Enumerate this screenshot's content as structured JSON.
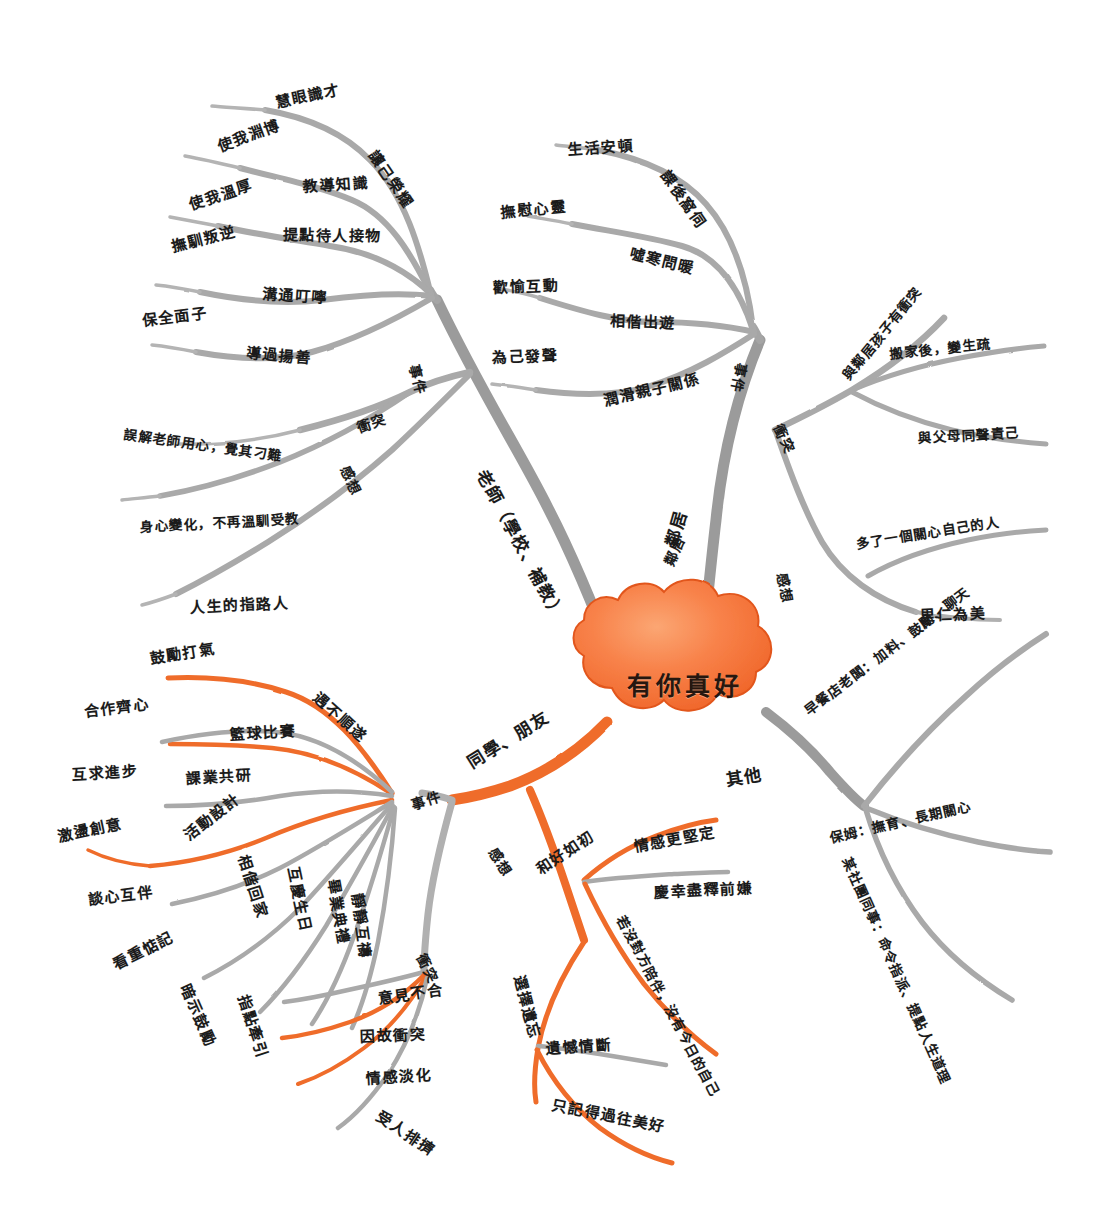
{
  "meta": {
    "title": "有你真好",
    "kind": "hand-drawn mind map",
    "colors": {
      "center_fill": "#f4733a",
      "center_fill_light": "#fa9a63",
      "branch_gray": "#a9a9a9",
      "branch_orange": "#ef6c2a",
      "text": "#1a1a1a",
      "background": "#ffffff"
    }
  },
  "center": {
    "label": "有你真好"
  },
  "branches": [
    {
      "id": "teacher",
      "label": "老師（學校、補教）",
      "color": "#a9a9a9",
      "categories": [
        {
          "label": "事件",
          "items": [
            "慧眼識才",
            "讓己榮耀",
            "使我淵博",
            "教導知識",
            "使我溫厚",
            "提點待人接物",
            "撫馴叛逆",
            "溝通叮嚀",
            "保全面子",
            "導過揚善"
          ]
        },
        {
          "label": "衝突",
          "items": [
            "誤解老師用心，覺其刁難",
            "身心變化，不再溫馴受教"
          ]
        },
        {
          "label": "感想",
          "items": [
            "人生的指路人"
          ]
        }
      ]
    },
    {
      "id": "neighbor",
      "label": "鄰居",
      "color": "#a9a9a9",
      "categories": [
        {
          "label": "事件",
          "items": [
            "生活安頓",
            "課後窩伺",
            "撫慰心靈",
            "噓寒問暖",
            "歡愉互動",
            "相偕出遊",
            "為己發聲",
            "潤滑親子關係"
          ]
        },
        {
          "label": "衝突",
          "items": [
            "與鄰居孩子有衝突",
            "搬家後，變生疏",
            "與父母同聲責己"
          ]
        },
        {
          "label": "感想",
          "items": [
            "多了一個關心自己的人",
            "里仁為美"
          ]
        }
      ]
    },
    {
      "id": "others",
      "label": "其他",
      "color": "#a9a9a9",
      "categories": [
        {
          "label": "",
          "items": [
            "早餐店老闆：加料、鼓勵、聊天",
            "保姆：撫育、長期關心",
            "某社團同事：命令指派、提點人生道理"
          ]
        }
      ]
    },
    {
      "id": "classmates",
      "label": "同學、朋友",
      "color": "#ef6c2a",
      "categories": [
        {
          "label": "事件",
          "items": [
            "鼓勵打氣",
            "遇不順遂",
            "合作齊心",
            "籃球比賽",
            "互求進步",
            "課業共研",
            "激盪創意",
            "活動設計",
            "談心互伴",
            "相偕回家",
            "互慶生日",
            "畢業典禮",
            "看重惦記",
            "暗示鼓勵",
            "指點牽引",
            "靜靜互禱"
          ]
        },
        {
          "label": "衝突",
          "items": [
            "意見不合",
            "因故衝突",
            "情感淡化",
            "受人排擠"
          ]
        },
        {
          "label": "感想",
          "items": [
            "情感更堅定",
            "慶幸盡釋前嫌",
            "和好如初",
            "若沒對方陪伴，沒有今日的自己",
            "選擇遺忘",
            "遺憾情斷",
            "只記得過往美好"
          ]
        }
      ]
    }
  ],
  "labels": {
    "center": "有你真好",
    "teacher_main": "老師（學校、補教）",
    "neighbor_main": "鄰居",
    "others_main": "其他",
    "classmates_main": "同學、朋友",
    "t_event": "事件",
    "t_conflict": "衝突",
    "t_feeling": "感想",
    "t1": "慧眼識才",
    "t2": "讓己榮耀",
    "t3": "使我淵博",
    "t4": "教導知識",
    "t5": "使我溫厚",
    "t6": "提點待人接物",
    "t7": "撫馴叛逆",
    "t8": "溝通叮嚀",
    "t9": "保全面子",
    "t10": "導過揚善",
    "tc1": "誤解老師用心，覺其刁難",
    "tc2": "身心變化，不再溫馴受教",
    "tf1": "人生的指路人",
    "n_event": "事件",
    "n_conflict": "衝突",
    "n_feeling": "感想",
    "n1": "生活安頓",
    "n2": "課後窩伺",
    "n3": "撫慰心靈",
    "n4": "噓寒問暖",
    "n5": "歡愉互動",
    "n6": "相偕出遊",
    "n7": "為己發聲",
    "n8": "潤滑親子關係",
    "nc1": "與鄰居孩子有衝突",
    "nc2": "搬家後，變生疏",
    "nc3": "與父母同聲責己",
    "nf1": "多了一個關心自己的人",
    "nf2": "里仁為美",
    "o1": "早餐店老闆：加料、鼓勵、聊天",
    "o2": "保姆：撫育、長期關心",
    "o3": "某社團同事：命令指派、提點人生道理",
    "c_event": "事件",
    "c_conflict": "衝突",
    "c_feeling": "感想",
    "c1": "鼓勵打氣",
    "c2": "遇不順遂",
    "c3": "合作齊心",
    "c4": "籃球比賽",
    "c5": "互求進步",
    "c6": "課業共研",
    "c7": "激盪創意",
    "c8": "活動設計",
    "c9": "談心互伴",
    "c10": "相偕回家",
    "c11": "互慶生日",
    "c12": "畢業典禮",
    "c13": "看重惦記",
    "c14": "暗示鼓勵",
    "c15": "指點牽引",
    "c16": "靜靜互禱",
    "cc1": "意見不合",
    "cc2": "因故衝突",
    "cc3": "情感淡化",
    "cc4": "受人排擠",
    "cf1": "情感更堅定",
    "cf2": "慶幸盡釋前嫌",
    "cf3": "和好如初",
    "cf4": "若沒對方陪伴，沒有今日的自己",
    "cf5": "選擇遺忘",
    "cf6": "遺憾情斷",
    "cf7": "只記得過往美好"
  }
}
